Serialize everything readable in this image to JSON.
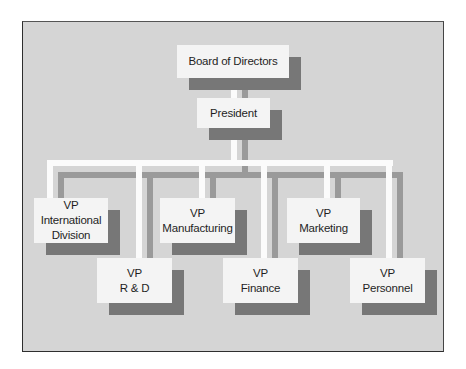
{
  "chart": {
    "type": "organization-chart",
    "colors": {
      "frame_background": "#d5d5d5",
      "box_fill": "#f4f4f4",
      "box_shadow": "#777777",
      "connector": "#fbfbfb",
      "connector_shadow": "#9a9a9a",
      "border": "#2e2e2e"
    },
    "top": {
      "board": {
        "label": "Board of Directors"
      },
      "president": {
        "label": "President"
      }
    },
    "vps": [
      {
        "line1": "VP",
        "line2": "International",
        "line3": "Division"
      },
      {
        "line1": "VP",
        "line2": "R & D"
      },
      {
        "line1": "VP",
        "line2": "Manufacturing"
      },
      {
        "line1": "VP",
        "line2": "Finance"
      },
      {
        "line1": "VP",
        "line2": "Marketing"
      },
      {
        "line1": "VP",
        "line2": "Personnel"
      }
    ]
  }
}
